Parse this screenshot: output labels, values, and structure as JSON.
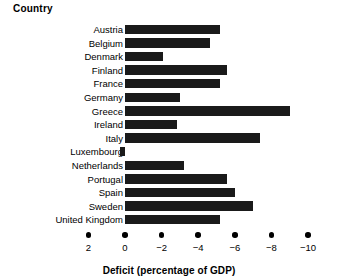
{
  "chart_data": {
    "type": "bar",
    "orientation": "horizontal",
    "title": "",
    "xlabel": "Deficit (percentage of GDP)",
    "ylabel": "Country",
    "categories": [
      "Austria",
      "Belgium",
      "Denmark",
      "Finland",
      "France",
      "Germany",
      "Greece",
      "Ireland",
      "Italy",
      "Luxembourg",
      "Netherlands",
      "Portugal",
      "Spain",
      "Sweden",
      "United Kingdom"
    ],
    "values": [
      -5.2,
      -4.65,
      -2.05,
      -5.55,
      -5.2,
      -3.0,
      -9.0,
      -2.85,
      -7.4,
      0.3,
      -3.2,
      -5.55,
      -6.0,
      -7.0,
      -5.2
    ],
    "xlim": [
      2,
      -10
    ],
    "xticks": [
      2,
      0,
      -2,
      -4,
      -6,
      -8,
      -10
    ],
    "xticklabels": [
      "2",
      "0",
      "−2",
      "−4",
      "−6",
      "−8",
      "−10"
    ],
    "axis_inverted": true,
    "grid": false,
    "legend": false,
    "bar_color": "#1a1a1a",
    "background_color": "#ffffff"
  },
  "labels": {
    "category_header": "Country",
    "axis_title": "Deficit (percentage of GDP)"
  }
}
